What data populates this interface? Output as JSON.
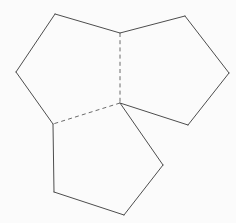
{
  "figure": {
    "canvas": {
      "width": 236,
      "height": 223,
      "background_color": "#fbfbfb"
    },
    "style": {
      "solid_line_color": "#4d4d4d",
      "dashed_line_color": "#6b6b6b",
      "line_width": 1,
      "dash_pattern": "4 3.2"
    },
    "vertices": {
      "top_junction": {
        "id": "A",
        "x": 120,
        "y": 33
      },
      "center_junction": {
        "id": "B",
        "x": 120,
        "y": 103
      },
      "left_lower_junction": {
        "id": "C",
        "x": 53,
        "y": 124
      },
      "left_top": {
        "id": "D",
        "x": 55,
        "y": 14
      },
      "left_west": {
        "id": "E",
        "x": 16,
        "y": 72
      },
      "right_top": {
        "id": "F",
        "x": 185,
        "y": 16
      },
      "right_east": {
        "id": "G",
        "x": 229,
        "y": 73
      },
      "right_bottom": {
        "id": "H",
        "x": 188,
        "y": 125
      },
      "bottom_east": {
        "id": "I",
        "x": 163,
        "y": 165
      },
      "bottom_south": {
        "id": "J",
        "x": 124,
        "y": 215
      },
      "bottom_west": {
        "id": "K",
        "x": 54,
        "y": 192
      }
    },
    "polygons": [
      {
        "name": "left-pentagon",
        "points": "55,14 120,33 120,103 53,124 16,72",
        "sides": 5
      },
      {
        "name": "right-pentagon",
        "points": "120,33 185,16 229,73 188,125 120,103",
        "sides": 5
      },
      {
        "name": "bottom-pentagon",
        "points": "53,124 120,103 163,165 124,215 54,192",
        "sides": 5
      }
    ],
    "edges": {
      "solid": [
        {
          "name": "left-pentagon-top-left-edge",
          "d": "M 55,14 L 16,72"
        },
        {
          "name": "left-pentagon-top-right-edge",
          "d": "M 55,14 L 120,33"
        },
        {
          "name": "left-pentagon-west-lower-edge",
          "d": "M 16,72 L 53,124"
        },
        {
          "name": "right-pentagon-top-edge",
          "d": "M 120,33 L 185,16"
        },
        {
          "name": "right-pentagon-upper-right-edge",
          "d": "M 185,16 L 229,73"
        },
        {
          "name": "right-pentagon-lower-right-edge",
          "d": "M 229,73 L 188,125"
        },
        {
          "name": "right-pentagon-bottom-edge",
          "d": "M 188,125 L 120,103"
        },
        {
          "name": "bottom-pentagon-upper-right-edge",
          "d": "M 120,103 L 163,165"
        },
        {
          "name": "bottom-pentagon-lower-right-edge",
          "d": "M 163,165 L 124,215"
        },
        {
          "name": "bottom-pentagon-bottom-edge",
          "d": "M 124,215 L 54,192"
        },
        {
          "name": "bottom-pentagon-left-edge",
          "d": "M 54,192 L 53,124"
        }
      ],
      "dashed": [
        {
          "name": "hidden-edge-vertical",
          "d": "M 120,33 L 120,103"
        },
        {
          "name": "hidden-edge-diagonal",
          "d": "M 120,103 L 53,124"
        }
      ]
    }
  }
}
